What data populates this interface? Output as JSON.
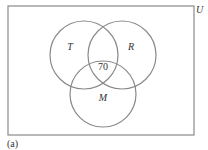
{
  "diagram": {
    "type": "venn",
    "universe": {
      "label": "U",
      "rect": {
        "x": 8,
        "y": 6,
        "width": 186,
        "height": 129
      }
    },
    "sets": [
      {
        "id": "T",
        "label": "T",
        "cx": 84,
        "cy": 55,
        "r": 34,
        "label_pos": {
          "x": 70,
          "y": 50
        }
      },
      {
        "id": "R",
        "label": "R",
        "cx": 122,
        "cy": 55,
        "r": 34,
        "label_pos": {
          "x": 131,
          "y": 50
        }
      },
      {
        "id": "M",
        "label": "M",
        "cx": 103,
        "cy": 94,
        "r": 33,
        "label_pos": {
          "x": 103,
          "y": 101
        }
      }
    ],
    "regions": [
      {
        "region": "T∩R∩M",
        "value": "70",
        "pos": {
          "x": 103,
          "y": 70
        }
      }
    ],
    "caption": "(a)",
    "colors": {
      "stroke": "#8a8a8a",
      "text": "#333333",
      "background": "#ffffff"
    }
  }
}
